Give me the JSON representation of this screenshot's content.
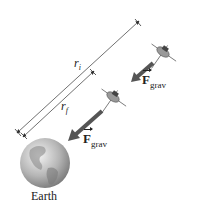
{
  "diagram": {
    "distance_labels": {
      "initial": {
        "symbol": "r",
        "subscript": "i"
      },
      "final": {
        "symbol": "r",
        "subscript": "f"
      }
    },
    "force_labels": [
      {
        "symbol": "F",
        "subscript": "grav",
        "position": "near-satellite"
      },
      {
        "symbol": "F",
        "subscript": "grav",
        "position": "near-earth"
      }
    ],
    "body_label": "Earth",
    "colors": {
      "line": "#333333",
      "arrow": "#555555",
      "earth": "#9a9a9a"
    }
  }
}
